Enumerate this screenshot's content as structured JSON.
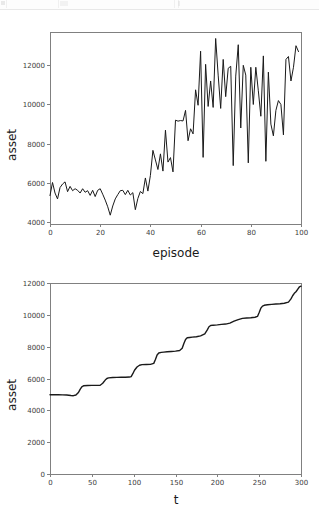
{
  "window": {
    "background_color": "#ffffff",
    "top_sliver_visible": true
  },
  "chart_data": [
    {
      "id": "episode-asset-chart",
      "type": "line",
      "title": "",
      "xlabel": "episode",
      "ylabel": "asset",
      "xlim": [
        0,
        100
      ],
      "ylim": [
        3900,
        13700
      ],
      "xticks": [
        0,
        20,
        40,
        60,
        80,
        100
      ],
      "yticks": [
        4000,
        6000,
        8000,
        10000,
        12000
      ],
      "xtick_labels": [
        "0",
        "20",
        "40",
        "60",
        "80",
        "100"
      ],
      "ytick_labels": [
        "4000",
        "6000",
        "8000",
        "10000",
        "12000"
      ],
      "grid": false,
      "legend": null,
      "line_color": "#1a1a1a",
      "series": [
        {
          "name": "asset",
          "x": [
            0,
            1,
            2,
            3,
            4,
            5,
            6,
            7,
            8,
            9,
            10,
            11,
            12,
            13,
            14,
            15,
            16,
            17,
            18,
            19,
            20,
            21,
            22,
            23,
            24,
            25,
            26,
            27,
            28,
            29,
            30,
            31,
            32,
            33,
            34,
            35,
            36,
            37,
            38,
            39,
            40,
            41,
            42,
            43,
            44,
            45,
            46,
            47,
            48,
            49,
            50,
            51,
            52,
            53,
            54,
            55,
            56,
            57,
            58,
            59,
            60,
            61,
            62,
            63,
            64,
            65,
            66,
            67,
            68,
            69,
            70,
            71,
            72,
            73,
            74,
            75,
            76,
            77,
            78,
            79,
            80,
            81,
            82,
            83,
            84,
            85,
            86,
            87,
            88,
            89,
            90,
            91,
            92,
            93,
            94,
            95,
            96,
            97,
            98,
            99
          ],
          "values": [
            5350,
            6020,
            5480,
            5180,
            5760,
            5940,
            6050,
            5550,
            5820,
            5600,
            5700,
            5620,
            5480,
            5700,
            5520,
            5600,
            5360,
            5620,
            5300,
            5620,
            5700,
            5420,
            5120,
            4780,
            4350,
            4820,
            5180,
            5400,
            5600,
            5620,
            5400,
            5620,
            5380,
            5500,
            4630,
            5200,
            5560,
            5450,
            6250,
            5580,
            6380,
            7660,
            7170,
            6680,
            7480,
            6600,
            8690,
            7060,
            7290,
            6560,
            9200,
            9150,
            9180,
            9160,
            9700,
            8150,
            8760,
            8500,
            10750,
            9960,
            12720,
            7300,
            12050,
            9900,
            11200,
            9850,
            13370,
            11500,
            9800,
            12300,
            10400,
            11850,
            11950,
            6880,
            11450,
            13050,
            8800,
            12000,
            11500,
            7020,
            11900,
            10000,
            11900,
            10700,
            9400,
            12480,
            7100,
            11650,
            9000,
            8400,
            9700,
            10200,
            10000,
            8450,
            12300,
            12450,
            11200,
            11900,
            13000,
            12700
          ]
        }
      ]
    },
    {
      "id": "t-asset-chart",
      "type": "line",
      "title": "",
      "xlabel": "t",
      "ylabel": "asset",
      "xlim": [
        0,
        300
      ],
      "ylim": [
        0,
        12000
      ],
      "xticks": [
        0,
        50,
        100,
        150,
        200,
        250,
        300
      ],
      "yticks": [
        0,
        2000,
        4000,
        6000,
        8000,
        10000,
        12000
      ],
      "xtick_labels": [
        "0",
        "50",
        "100",
        "150",
        "200",
        "250",
        "300"
      ],
      "ytick_labels": [
        "0",
        "2000",
        "4000",
        "6000",
        "8000",
        "10000",
        "12000"
      ],
      "grid": false,
      "legend": null,
      "line_color": "#1a1a1a",
      "series": [
        {
          "name": "asset",
          "x": [
            0,
            5,
            10,
            15,
            20,
            25,
            28,
            31,
            34,
            36,
            38,
            40,
            45,
            50,
            55,
            60,
            63,
            66,
            68,
            70,
            75,
            80,
            85,
            90,
            95,
            97,
            99,
            101,
            104,
            107,
            110,
            115,
            120,
            124,
            126,
            128,
            130,
            133,
            136,
            140,
            145,
            150,
            155,
            158,
            160,
            162,
            164,
            167,
            170,
            175,
            180,
            185,
            188,
            190,
            192,
            195,
            200,
            205,
            210,
            215,
            220,
            225,
            230,
            235,
            240,
            245,
            248,
            250,
            252,
            254,
            256,
            260,
            265,
            270,
            275,
            280,
            285,
            288,
            290,
            292,
            294,
            296,
            298,
            300
          ],
          "values": [
            4980,
            4980,
            4980,
            4970,
            4960,
            4930,
            4920,
            4960,
            5120,
            5320,
            5480,
            5540,
            5560,
            5570,
            5570,
            5580,
            5700,
            5900,
            6000,
            6040,
            6060,
            6070,
            6080,
            6080,
            6090,
            6120,
            6300,
            6520,
            6720,
            6830,
            6870,
            6880,
            6890,
            6950,
            7200,
            7480,
            7600,
            7640,
            7660,
            7680,
            7700,
            7720,
            7760,
            7900,
            8200,
            8450,
            8560,
            8580,
            8600,
            8620,
            8680,
            8800,
            9050,
            9250,
            9330,
            9350,
            9370,
            9400,
            9420,
            9480,
            9600,
            9700,
            9780,
            9800,
            9820,
            9850,
            9900,
            10150,
            10420,
            10550,
            10600,
            10630,
            10660,
            10680,
            10700,
            10730,
            10800,
            11000,
            11200,
            11350,
            11450,
            11600,
            11750,
            11800
          ]
        }
      ]
    }
  ]
}
